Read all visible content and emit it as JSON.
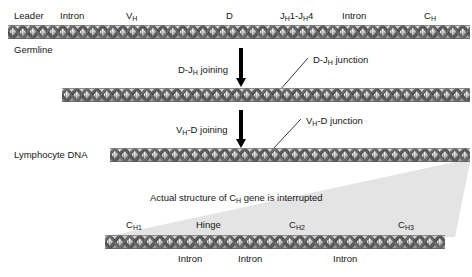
{
  "figure": {
    "background_color": "#ffffff",
    "dna_color": "#b3b3b3",
    "wedge_color": "#e4e4e4",
    "arrow_color": "#000000"
  },
  "germline": {
    "row_label": "Germline",
    "segments": [
      {
        "label": "Leader",
        "x": 14
      },
      {
        "label": "Intron",
        "x": 60
      },
      {
        "label": "V",
        "sub": "H",
        "x": 126
      },
      {
        "label": "D",
        "x": 226
      },
      {
        "label": "J",
        "sub": "H",
        "tail": "1-J",
        "sub2": "H",
        "tail2": "4",
        "x": 280
      },
      {
        "label": "Intron",
        "x": 342
      },
      {
        "label": "C",
        "sub": "H",
        "x": 424
      }
    ]
  },
  "step1": {
    "arrow_label": "D-J",
    "arrow_label_sub": "H",
    "arrow_label_tail": " joining",
    "junction_label": "D-J",
    "junction_label_sub": "H",
    "junction_label_tail": " junction"
  },
  "step2": {
    "arrow_label": "V",
    "arrow_label_sub": "H",
    "arrow_label_tail": "-D joining",
    "junction_label": "V",
    "junction_label_sub": "H",
    "junction_label_tail": "-D junction",
    "row_label": "Lymphocyte DNA"
  },
  "expanded": {
    "caption_pre": "Actual structure of C",
    "caption_sub": "H",
    "caption_post": " gene is interrupted",
    "exons": [
      {
        "label": "C",
        "sub": "H1",
        "x": 126
      },
      {
        "label": "Hinge",
        "x": 196
      },
      {
        "label": "C",
        "sub": "H2",
        "x": 289
      },
      {
        "label": "C",
        "sub": "H3",
        "x": 398
      }
    ],
    "introns": [
      {
        "label": "Intron",
        "x": 178
      },
      {
        "label": "Intron",
        "x": 238
      },
      {
        "label": "Intron",
        "x": 333
      }
    ]
  }
}
